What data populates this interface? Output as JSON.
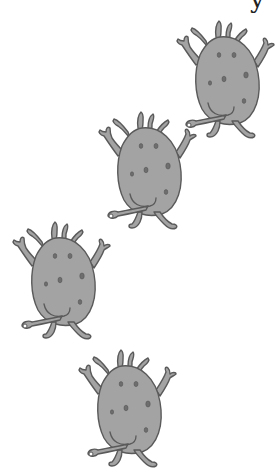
{
  "page": {
    "background": "#ffffff"
  },
  "partial_text": {
    "glyph": "y"
  },
  "colors": {
    "body": "#a3a3a3",
    "outline": "#5a5a5a",
    "spot": "#6e6e6e"
  },
  "monsters": [
    {
      "name": "monster-1",
      "left": 172,
      "top": 17,
      "scale": 1.0
    },
    {
      "name": "monster-2",
      "left": 94,
      "top": 108,
      "scale": 1.0
    },
    {
      "name": "monster-3",
      "left": 8,
      "top": 218,
      "scale": 1.0
    },
    {
      "name": "monster-4",
      "left": 74,
      "top": 346,
      "scale": 1.0
    }
  ]
}
